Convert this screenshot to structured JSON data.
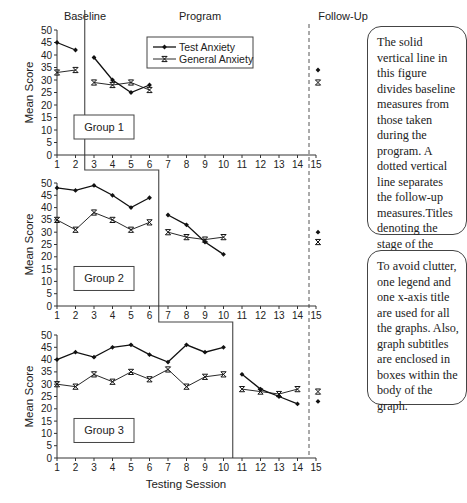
{
  "chart_data": {
    "type": "line",
    "title": "",
    "xlabel": "Testing Session",
    "ylabel": "Mean Score",
    "ylim": [
      0,
      50
    ],
    "yticks": [
      0,
      5,
      10,
      15,
      20,
      25,
      30,
      35,
      40,
      45,
      50
    ],
    "xticks": [
      1,
      2,
      3,
      4,
      5,
      6,
      7,
      8,
      9,
      10,
      11,
      12,
      13,
      14,
      15
    ],
    "stage_titles": [
      "Baseline",
      "Program",
      "Follow-Up"
    ],
    "legend": [
      "Test Anxiety",
      "General Anxiety"
    ],
    "legend_position": "top panel, upper middle",
    "grid": false,
    "panels": [
      {
        "subtitle": "Group 1",
        "phase_break_after": 2,
        "series": [
          {
            "name": "Test Anxiety",
            "baseline": {
              "x": [
                1,
                2
              ],
              "y": [
                45,
                42
              ]
            },
            "program": {
              "x": [
                3,
                4,
                5,
                6
              ],
              "y": [
                39,
                30,
                25,
                28
              ]
            },
            "followup": {
              "x": [
                15
              ],
              "y": [
                34
              ]
            }
          },
          {
            "name": "General Anxiety",
            "baseline": {
              "x": [
                1,
                2
              ],
              "y": [
                33,
                34
              ]
            },
            "program": {
              "x": [
                3,
                4,
                5,
                6
              ],
              "y": [
                29,
                28,
                29,
                26
              ]
            },
            "followup": {
              "x": [
                15
              ],
              "y": [
                29
              ]
            }
          }
        ]
      },
      {
        "subtitle": "Group 2",
        "phase_break_after": 6,
        "series": [
          {
            "name": "Test Anxiety",
            "baseline": {
              "x": [
                1,
                2,
                3,
                4,
                5,
                6
              ],
              "y": [
                48,
                47,
                49,
                45,
                40,
                44
              ]
            },
            "program": {
              "x": [
                7,
                8,
                9,
                10
              ],
              "y": [
                37,
                33,
                26,
                21
              ]
            },
            "followup": {
              "x": [
                15
              ],
              "y": [
                30
              ]
            }
          },
          {
            "name": "General Anxiety",
            "baseline": {
              "x": [
                1,
                2,
                3,
                4,
                5,
                6
              ],
              "y": [
                35,
                31,
                38,
                35,
                31,
                34
              ]
            },
            "program": {
              "x": [
                7,
                8,
                9,
                10
              ],
              "y": [
                30,
                28,
                27,
                28
              ]
            },
            "followup": {
              "x": [
                15
              ],
              "y": [
                26
              ]
            }
          }
        ]
      },
      {
        "subtitle": "Group 3",
        "phase_break_after": 10,
        "series": [
          {
            "name": "Test Anxiety",
            "baseline": {
              "x": [
                1,
                2,
                3,
                4,
                5,
                6,
                7,
                8,
                9,
                10
              ],
              "y": [
                40,
                43,
                41,
                45,
                46,
                42,
                39,
                46,
                43,
                45
              ]
            },
            "program": {
              "x": [
                11,
                12,
                13,
                14
              ],
              "y": [
                34,
                28,
                25,
                22
              ]
            },
            "followup": {
              "x": [
                15
              ],
              "y": [
                23
              ]
            }
          },
          {
            "name": "General Anxiety",
            "baseline": {
              "x": [
                1,
                2,
                3,
                4,
                5,
                6,
                7,
                8,
                9,
                10
              ],
              "y": [
                30,
                29,
                34,
                31,
                35,
                32,
                36,
                29,
                33,
                34
              ]
            },
            "program": {
              "x": [
                11,
                12,
                13,
                14
              ],
              "y": [
                28,
                27,
                26,
                28
              ]
            },
            "followup": {
              "x": [
                15
              ],
              "y": [
                27
              ]
            }
          }
        ]
      }
    ]
  },
  "notes": {
    "note1": "The solid vertical line in this figure divides baseline measures from those taken during the program. A dotted vertical line separates the follow-up measures.Titles denoting the stage of the evaluation are at the top.",
    "note2": "To avoid clutter, one legend and one x-axis title are used for all the graphs. Also, graph subtitles are enclosed in boxes within the body of the graph."
  }
}
